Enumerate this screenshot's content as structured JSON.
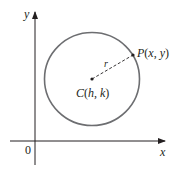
{
  "diagram": {
    "type": "circle-on-coordinate-plane",
    "axes": {
      "x_label": "x",
      "y_label": "y",
      "origin_label": "0"
    },
    "circle": {
      "center_label": "C(h, k)",
      "center_label_parts": {
        "letter": "C",
        "open": "(",
        "h": "h",
        "comma": ", ",
        "k": "k",
        "close": ")"
      },
      "point_label": "P(x, y)",
      "point_label_parts": {
        "letter": "P",
        "open": "(",
        "x": "x",
        "comma": ", ",
        "y": "y",
        "close": ")"
      },
      "radius_label": "r"
    },
    "colors": {
      "circle_stroke": "#6d6e71",
      "axis_stroke": "#231f20",
      "text": "#231f20",
      "background": "#ffffff"
    }
  }
}
